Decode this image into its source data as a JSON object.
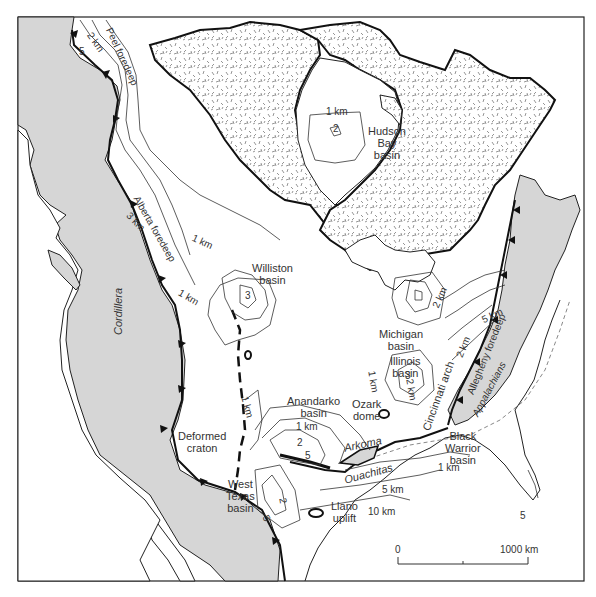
{
  "map": {
    "colors": {
      "background": "#ffffff",
      "cordillera_fill": "#d6d6d6",
      "appalachian_fill": "#d6d6d6",
      "shield_pattern": "#777777",
      "line": "#1a1a1a",
      "text": "#333333"
    },
    "regions": {
      "cordillera": "Cordillera",
      "appalachians": "Appalachians",
      "ouachitas": "Ouachitas",
      "deformed_craton": [
        "Deformed",
        "craton"
      ]
    },
    "basins": {
      "hudson_bay": [
        "Hudson",
        "Bay",
        "basin"
      ],
      "williston": [
        "Williston",
        "basin"
      ],
      "michigan": [
        "Michigan",
        "basin"
      ],
      "illinois": [
        "Illinois",
        "basin"
      ],
      "anadarko": [
        "Anandarko",
        "basin"
      ],
      "west_texas": [
        "West",
        "Texas",
        "basin"
      ],
      "black_warrior": [
        "Black",
        "Warrior",
        "basin"
      ],
      "arkoma": "Arkoma"
    },
    "structures": {
      "ozark_dome": [
        "Ozark",
        "dome"
      ],
      "llano_uplift": [
        "Llano",
        "uplift"
      ],
      "cincinnati_arch": "Cincinnati arch"
    },
    "foredeeps": {
      "peel": "Peel foredeep",
      "alberta": "Alberta foredeep",
      "allegheny": "Allegheny foredeep"
    },
    "contours": {
      "hudson_1": "1 km",
      "hudson_2": "2",
      "peel_2": "2 km",
      "peel_5": "5",
      "alberta_3": "3 km",
      "alberta_1": "1 km",
      "williston_1": "1 km",
      "williston_3": "3",
      "anadarko_1": "1 km",
      "anadarko_2": "2",
      "anadarko_5": "5",
      "westtexas_1": "1 km",
      "permian_2": "2",
      "permian_5": "5",
      "michigan_2": "2 km",
      "illinois_1": "1 km",
      "illinois_2": "2 km",
      "illinois_3": "3",
      "allegheny_2": "2 km",
      "allegheny_5": "5 km",
      "gulf_1": "1 km",
      "gulf_5": "5 km",
      "gulf_10": "10 km",
      "florida_5": "5"
    },
    "scale_bar": {
      "start": "0",
      "end": "1000 km"
    }
  }
}
